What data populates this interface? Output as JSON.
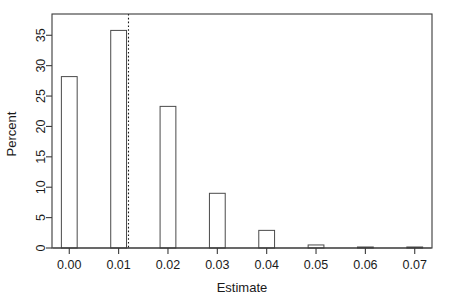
{
  "chart_data": {
    "type": "bar",
    "title": "",
    "subtitle": "",
    "xlabel": "Estimate",
    "ylabel": "Percent",
    "categories": [
      "0.00",
      "0.01",
      "0.02",
      "0.03",
      "0.04",
      "0.05",
      "0.06",
      "0.07"
    ],
    "x": [
      0.0,
      0.01,
      0.02,
      0.03,
      0.04,
      0.05,
      0.06,
      0.07
    ],
    "values": [
      28.2,
      35.8,
      23.3,
      9.0,
      2.9,
      0.5,
      0.1,
      0.1
    ],
    "bar_width": 0.0016,
    "xlim": [
      -0.0035,
      0.0735
    ],
    "ylim": [
      0,
      38.5
    ],
    "xticks": [
      0.0,
      0.01,
      0.02,
      0.03,
      0.04,
      0.05,
      0.06,
      0.07
    ],
    "xticklabels": [
      "0.00",
      "0.01",
      "0.02",
      "0.03",
      "0.04",
      "0.05",
      "0.06",
      "0.07"
    ],
    "yticks": [
      0,
      5,
      10,
      15,
      20,
      25,
      30,
      35
    ],
    "yticklabels": [
      "0",
      "5",
      "10",
      "15",
      "20",
      "25",
      "30",
      "35"
    ],
    "grid": false,
    "legend": null,
    "annotations": [
      {
        "name": "reference-line",
        "type": "vertical-dotted-line",
        "x": 0.012,
        "style": "dotted",
        "color": "#1a1a1a"
      }
    ],
    "colors": {
      "bar_fill": "#ffffff",
      "bar_stroke": "#4a4a4a",
      "axis": "#3a3a3a",
      "text": "#1a1a1a",
      "background": "#ffffff"
    }
  },
  "figure": {
    "width": 451,
    "height": 303,
    "plot_left": 52,
    "plot_right": 432,
    "plot_top": 14,
    "plot_bottom": 248
  }
}
